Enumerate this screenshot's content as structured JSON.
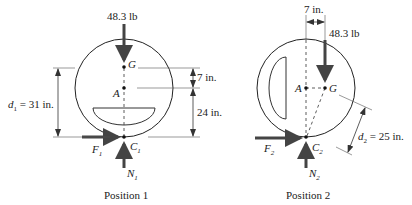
{
  "position1": {
    "caption": "Position 1",
    "weight_label": "48.3 lb",
    "point_G": "G",
    "point_A": "A",
    "point_C": "C",
    "point_C_sub": "1",
    "force_F": "F",
    "force_F_sub": "1",
    "force_N": "N",
    "force_N_sub": "1",
    "d_label_var": "d",
    "d_label_sub": "1",
    "d_label_value": " = 31 in.",
    "dim_GA": "7 in.",
    "dim_AC": "24 in."
  },
  "position2": {
    "caption": "Position 2",
    "weight_label": "48.3 lb",
    "point_G": "G",
    "point_A": "A",
    "point_C": "C",
    "point_C_sub": "2",
    "force_F": "F",
    "force_F_sub": "2",
    "force_N": "N",
    "force_N_sub": "2",
    "d_label_var": "d",
    "d_label_sub": "2",
    "d_label_value": " = 25 in.",
    "dim_AG": "7 in."
  },
  "colors": {
    "line": "#222222",
    "arrow": "#444444",
    "dim": "#333333"
  }
}
